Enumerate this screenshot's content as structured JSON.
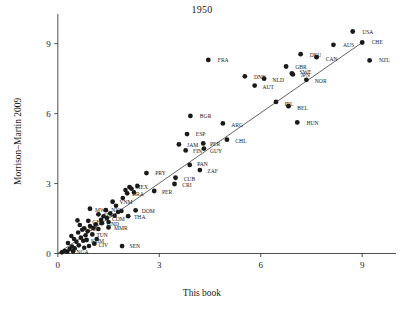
{
  "chart_data": {
    "type": "scatter",
    "title": "1950",
    "xlabel": "This book",
    "ylabel": "Morrison–Martin 2009",
    "xlim": [
      -0.35,
      10.0
    ],
    "ylim": [
      -0.45,
      10.1
    ],
    "xticks": [
      0,
      3,
      6,
      9
    ],
    "yticks": [
      0,
      3,
      6,
      9
    ],
    "xtick_labels": [
      "0",
      "3",
      "6",
      "9"
    ],
    "ytick_labels": [
      "0",
      "3",
      "6",
      "9"
    ],
    "grid": false,
    "legend": "none",
    "marker_color": "#1a1a1a",
    "line_color": "#4a4a4a",
    "fit_line": {
      "x0": 0.0,
      "y0": 0.0,
      "x1": 9.0,
      "y1": 9.05
    },
    "points": [
      {
        "label": "USA",
        "x": 8.72,
        "y": 9.52,
        "lx": 9.0,
        "ly": 9.52,
        "anchor": "start"
      },
      {
        "label": "CHE",
        "x": 9.0,
        "y": 9.05,
        "lx": 9.28,
        "ly": 9.05,
        "anchor": "start"
      },
      {
        "label": "AUS",
        "x": 8.15,
        "y": 8.95,
        "lx": 8.43,
        "ly": 8.95,
        "anchor": "start"
      },
      {
        "label": "DEU",
        "x": 7.18,
        "y": 8.55,
        "lx": 7.45,
        "ly": 8.5,
        "anchor": "start"
      },
      {
        "label": "CAN",
        "x": 7.65,
        "y": 8.42,
        "lx": 7.92,
        "ly": 8.34,
        "anchor": "start"
      },
      {
        "label": "NZL",
        "x": 9.22,
        "y": 8.28,
        "lx": 9.5,
        "ly": 8.28,
        "anchor": "start"
      },
      {
        "label": "FRA",
        "x": 4.45,
        "y": 8.3,
        "lx": 4.73,
        "ly": 8.3,
        "anchor": "start"
      },
      {
        "label": "GBR",
        "x": 6.75,
        "y": 8.02,
        "lx": 7.02,
        "ly": 8.02,
        "anchor": "start"
      },
      {
        "label": "SWE",
        "x": 6.92,
        "y": 7.72,
        "lx": 7.15,
        "ly": 7.78,
        "anchor": "start"
      },
      {
        "label": "JPN",
        "x": 6.95,
        "y": 7.68,
        "lx": 7.18,
        "ly": 7.64,
        "anchor": "start"
      },
      {
        "label": "DNK",
        "x": 5.53,
        "y": 7.6,
        "lx": 5.8,
        "ly": 7.58,
        "anchor": "start"
      },
      {
        "label": "NLD",
        "x": 6.1,
        "y": 7.5,
        "lx": 6.35,
        "ly": 7.43,
        "anchor": "start"
      },
      {
        "label": "NOR",
        "x": 7.35,
        "y": 7.45,
        "lx": 7.6,
        "ly": 7.4,
        "anchor": "start"
      },
      {
        "label": "AUT",
        "x": 5.82,
        "y": 7.2,
        "lx": 6.05,
        "ly": 7.15,
        "anchor": "start"
      },
      {
        "label": "IRL",
        "x": 6.45,
        "y": 6.5,
        "lx": 6.7,
        "ly": 6.42,
        "anchor": "start"
      },
      {
        "label": "BEL",
        "x": 6.82,
        "y": 6.32,
        "lx": 7.08,
        "ly": 6.25,
        "anchor": "start"
      },
      {
        "label": "BGR",
        "x": 3.92,
        "y": 5.9,
        "lx": 4.2,
        "ly": 5.9,
        "anchor": "start"
      },
      {
        "label": "HUN",
        "x": 7.08,
        "y": 5.62,
        "lx": 7.35,
        "ly": 5.6,
        "anchor": "start"
      },
      {
        "label": "ARG",
        "x": 4.88,
        "y": 5.58,
        "lx": 5.13,
        "ly": 5.52,
        "anchor": "start"
      },
      {
        "label": "ESP",
        "x": 3.82,
        "y": 5.12,
        "lx": 4.08,
        "ly": 5.12,
        "anchor": "start"
      },
      {
        "label": "CHL",
        "x": 5.0,
        "y": 4.88,
        "lx": 5.25,
        "ly": 4.83,
        "anchor": "start"
      },
      {
        "label": "JAM",
        "x": 3.58,
        "y": 4.68,
        "lx": 3.82,
        "ly": 4.66,
        "anchor": "start"
      },
      {
        "label": "PER",
        "x": 4.3,
        "y": 4.72,
        "lx": 4.5,
        "ly": 4.68,
        "anchor": "start"
      },
      {
        "label": "FIN",
        "x": 3.78,
        "y": 4.42,
        "lx": 4.0,
        "ly": 4.4,
        "anchor": "start"
      },
      {
        "label": "GUY",
        "x": 4.32,
        "y": 4.5,
        "lx": 4.5,
        "ly": 4.4,
        "anchor": "start"
      },
      {
        "label": "PAN",
        "x": 3.9,
        "y": 3.8,
        "lx": 4.12,
        "ly": 3.84,
        "anchor": "start"
      },
      {
        "label": "ZAF",
        "x": 4.2,
        "y": 3.58,
        "lx": 4.42,
        "ly": 3.52,
        "anchor": "start"
      },
      {
        "label": "PRY",
        "x": 2.62,
        "y": 3.45,
        "lx": 2.88,
        "ly": 3.45,
        "anchor": "start"
      },
      {
        "label": "CUB",
        "x": 3.48,
        "y": 3.25,
        "lx": 3.72,
        "ly": 3.2,
        "anchor": "start"
      },
      {
        "label": "CRI",
        "x": 3.45,
        "y": 2.98,
        "lx": 3.68,
        "ly": 2.95,
        "anchor": "start"
      },
      {
        "label": "MEX",
        "x": 2.12,
        "y": 2.85,
        "lx": 2.3,
        "ly": 2.84,
        "anchor": "start"
      },
      {
        "label": "PER",
        "x": 2.85,
        "y": 2.68,
        "lx": 3.08,
        "ly": 2.65,
        "anchor": "start"
      },
      {
        "label": "BRA",
        "x": 2.05,
        "y": 2.58,
        "lx": 2.2,
        "ly": 2.55,
        "anchor": "start"
      },
      {
        "label": "VNM",
        "x": 1.62,
        "y": 2.22,
        "lx": 1.82,
        "ly": 2.22,
        "anchor": "start"
      },
      {
        "label": "MWI",
        "x": 0.95,
        "y": 1.92,
        "lx": 1.1,
        "ly": 1.88,
        "anchor": "start"
      },
      {
        "label": "NIC",
        "x": 1.42,
        "y": 1.86,
        "lx": 1.58,
        "ly": 1.86,
        "anchor": "start"
      },
      {
        "label": "DOM",
        "x": 2.3,
        "y": 1.85,
        "lx": 2.48,
        "ly": 1.84,
        "anchor": "start"
      },
      {
        "label": "THA",
        "x": 2.08,
        "y": 1.6,
        "lx": 2.25,
        "ly": 1.58,
        "anchor": "start"
      },
      {
        "label": "SLV",
        "x": 1.2,
        "y": 1.68,
        "lx": 1.35,
        "ly": 1.64,
        "anchor": "start"
      },
      {
        "label": "COM",
        "x": 1.45,
        "y": 1.52,
        "lx": 1.6,
        "ly": 1.5,
        "anchor": "start"
      },
      {
        "label": "GHA",
        "x": 0.9,
        "y": 1.4,
        "lx": 1.02,
        "ly": 1.35,
        "anchor": "start"
      },
      {
        "label": "HND",
        "x": 1.3,
        "y": 1.3,
        "lx": 1.45,
        "ly": 1.28,
        "anchor": "start"
      },
      {
        "label": "MMR",
        "x": 1.5,
        "y": 1.12,
        "lx": 1.66,
        "ly": 1.1,
        "anchor": "start"
      },
      {
        "label": "BOL",
        "x": 0.78,
        "y": 1.08,
        "lx": 0.9,
        "ly": 1.05,
        "anchor": "start"
      },
      {
        "label": "TUN",
        "x": 1.02,
        "y": 0.82,
        "lx": 1.14,
        "ly": 0.78,
        "anchor": "start"
      },
      {
        "label": "KHM",
        "x": 0.85,
        "y": 0.58,
        "lx": 0.98,
        "ly": 0.54,
        "anchor": "start"
      },
      {
        "label": "CIV",
        "x": 1.08,
        "y": 0.42,
        "lx": 1.2,
        "ly": 0.38,
        "anchor": "start"
      },
      {
        "label": "NGA",
        "x": 0.45,
        "y": 0.1,
        "lx": 0.55,
        "ly": 0.05,
        "anchor": "start"
      },
      {
        "label": "SEN",
        "x": 1.9,
        "y": 0.32,
        "lx": 2.12,
        "ly": 0.32,
        "anchor": "start"
      }
    ],
    "unlabeled_points": [
      {
        "x": 0.12,
        "y": 0.05
      },
      {
        "x": 0.2,
        "y": 0.12
      },
      {
        "x": 0.28,
        "y": 0.08
      },
      {
        "x": 0.35,
        "y": 0.2
      },
      {
        "x": 0.42,
        "y": 0.3
      },
      {
        "x": 0.5,
        "y": 0.22
      },
      {
        "x": 0.3,
        "y": 0.45
      },
      {
        "x": 0.55,
        "y": 0.5
      },
      {
        "x": 0.62,
        "y": 0.35
      },
      {
        "x": 0.48,
        "y": 0.62
      },
      {
        "x": 0.68,
        "y": 0.68
      },
      {
        "x": 0.75,
        "y": 0.55
      },
      {
        "x": 0.4,
        "y": 0.75
      },
      {
        "x": 0.6,
        "y": 0.9
      },
      {
        "x": 0.82,
        "y": 0.78
      },
      {
        "x": 0.72,
        "y": 1.02
      },
      {
        "x": 0.88,
        "y": 0.95
      },
      {
        "x": 0.95,
        "y": 1.18
      },
      {
        "x": 1.05,
        "y": 1.1
      },
      {
        "x": 1.12,
        "y": 1.25
      },
      {
        "x": 1.2,
        "y": 1.05
      },
      {
        "x": 0.65,
        "y": 1.22
      },
      {
        "x": 1.28,
        "y": 1.45
      },
      {
        "x": 1.35,
        "y": 1.6
      },
      {
        "x": 1.55,
        "y": 1.72
      },
      {
        "x": 1.68,
        "y": 1.62
      },
      {
        "x": 1.78,
        "y": 1.78
      },
      {
        "x": 1.88,
        "y": 1.82
      },
      {
        "x": 1.72,
        "y": 2.05
      },
      {
        "x": 1.92,
        "y": 2.38
      },
      {
        "x": 2.0,
        "y": 2.72
      },
      {
        "x": 2.18,
        "y": 2.78
      },
      {
        "x": 2.25,
        "y": 2.62
      },
      {
        "x": 2.35,
        "y": 2.9
      },
      {
        "x": 1.5,
        "y": 1.35
      },
      {
        "x": 0.58,
        "y": 1.42
      },
      {
        "x": 1.15,
        "y": 0.62
      },
      {
        "x": 0.78,
        "y": 0.25
      },
      {
        "x": 0.92,
        "y": 0.32
      }
    ]
  }
}
